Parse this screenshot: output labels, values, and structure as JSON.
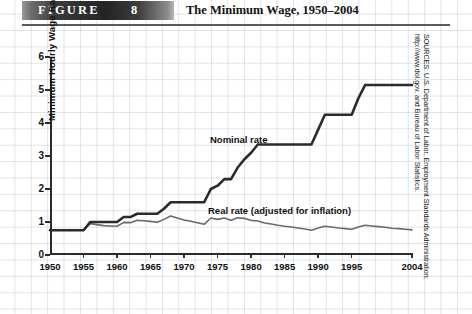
{
  "header": {
    "figure_label": "FIGURE",
    "figure_number": "8",
    "title": "The Minimum Wage, 1950–2004"
  },
  "source_note": "SOURCES: U.S. Department of Labor, Employment Standards Administration, http://www.dol.gov, and Bureau of Labor Statistics,",
  "annotations": {
    "nominal": "Nominal rate",
    "real": "Real rate (adjusted for inflation)"
  },
  "colors": {
    "nominal_line": "#2b2b2b",
    "real_line": "#6a6a6a",
    "axis": "#2b2b2b",
    "banner_dark": "#242424",
    "grid": "#96a5be"
  },
  "chart_data": {
    "type": "line",
    "title": "The Minimum Wage, 1950–2004",
    "xlabel": "",
    "ylabel": "Minimum Hourly Wage Rate",
    "xlim": [
      1950,
      2004
    ],
    "ylim": [
      0,
      6
    ],
    "grid": true,
    "legend": "inline-annotations",
    "ytick_labels": [
      "0",
      "1",
      "2",
      "3",
      "4",
      "5",
      "6"
    ],
    "ytick_values": [
      0,
      1,
      2,
      3,
      4,
      5,
      6
    ],
    "xtick_labels": [
      "1950",
      "1955",
      "1960",
      "1965",
      "1970",
      "1975",
      "1980",
      "1985",
      "1990",
      "1995",
      "2004"
    ],
    "xtick_values": [
      1950,
      1955,
      1960,
      1965,
      1970,
      1975,
      1980,
      1985,
      1990,
      1995,
      2004
    ],
    "x": [
      1950,
      1951,
      1952,
      1953,
      1954,
      1955,
      1956,
      1957,
      1958,
      1959,
      1960,
      1961,
      1962,
      1963,
      1964,
      1965,
      1966,
      1967,
      1968,
      1969,
      1970,
      1971,
      1972,
      1973,
      1974,
      1975,
      1976,
      1977,
      1978,
      1979,
      1980,
      1981,
      1982,
      1983,
      1984,
      1985,
      1986,
      1987,
      1988,
      1989,
      1990,
      1991,
      1992,
      1993,
      1994,
      1995,
      1996,
      1997,
      1998,
      1999,
      2000,
      2001,
      2002,
      2003,
      2004
    ],
    "series": [
      {
        "name": "Nominal rate",
        "color": "#2b2b2b",
        "width": 2.6,
        "values": [
          0.75,
          0.75,
          0.75,
          0.75,
          0.75,
          0.75,
          1.0,
          1.0,
          1.0,
          1.0,
          1.0,
          1.15,
          1.15,
          1.25,
          1.25,
          1.25,
          1.25,
          1.4,
          1.6,
          1.6,
          1.6,
          1.6,
          1.6,
          1.6,
          2.0,
          2.1,
          2.3,
          2.3,
          2.65,
          2.9,
          3.1,
          3.35,
          3.35,
          3.35,
          3.35,
          3.35,
          3.35,
          3.35,
          3.35,
          3.35,
          3.8,
          4.25,
          4.25,
          4.25,
          4.25,
          4.25,
          4.75,
          5.15,
          5.15,
          5.15,
          5.15,
          5.15,
          5.15,
          5.15,
          5.15
        ]
      },
      {
        "name": "Real rate (adjusted for inflation)",
        "color": "#6a6a6a",
        "width": 1.6,
        "values": [
          0.75,
          0.75,
          0.75,
          0.75,
          0.75,
          0.75,
          0.95,
          0.92,
          0.89,
          0.88,
          0.87,
          0.99,
          0.98,
          1.05,
          1.04,
          1.02,
          0.99,
          1.08,
          1.18,
          1.12,
          1.06,
          1.02,
          0.98,
          0.93,
          1.12,
          1.08,
          1.12,
          1.05,
          1.13,
          1.11,
          1.05,
          1.03,
          0.97,
          0.94,
          0.9,
          0.87,
          0.85,
          0.82,
          0.79,
          0.75,
          0.82,
          0.87,
          0.85,
          0.82,
          0.8,
          0.78,
          0.85,
          0.9,
          0.88,
          0.86,
          0.84,
          0.81,
          0.8,
          0.78,
          0.76
        ]
      }
    ]
  }
}
